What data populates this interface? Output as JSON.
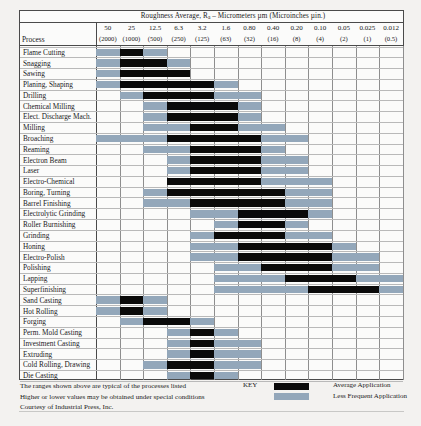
{
  "header": {
    "title_prefix": "Roughness Average, R",
    "title_sub": "a",
    "title_suffix": " – Micrometers µm (Microinches µin.)",
    "process_column_label": "Process"
  },
  "legend": {
    "key_word": "KEY",
    "avg_label": "Average Application",
    "less_label": "Less Frequent Application",
    "avg_color": "#0a0a0a",
    "less_color": "#93a7ba"
  },
  "footnotes": [
    "The ranges shown above are typical of the processes listed",
    "Higher or lower values may be obtained under special conditions",
    "Courtesy of Industrial Press, Inc."
  ],
  "chart_data": {
    "type": "heatmap",
    "title": "Roughness Average, Ra – Micrometers µm (Microinches µin.)",
    "xlabel": "",
    "ylabel": "Process",
    "legend_position": "bottom-right",
    "grid": true,
    "categories_micrometers": [
      "50",
      "25",
      "12.5",
      "6.3",
      "3.2",
      "1.6",
      "0.80",
      "0.40",
      "0.20",
      "0.10",
      "0.05",
      "0.025",
      "0.012"
    ],
    "categories_microinches": [
      "(2000)",
      "(1000)",
      "(500)",
      "(250)",
      "(125)",
      "(63)",
      "(32)",
      "(16)",
      "(8)",
      "(4)",
      "(2)",
      "(1)",
      "(0.5)"
    ],
    "value_legend": {
      "0": "none",
      "1": "Less Frequent Application",
      "2": "Average Application"
    },
    "rows": [
      {
        "process": "Flame Cutting",
        "values": [
          1,
          2,
          1,
          0,
          0,
          0,
          0,
          0,
          0,
          0,
          0,
          0,
          0
        ]
      },
      {
        "process": "Snagging",
        "values": [
          1,
          2,
          2,
          1,
          0,
          0,
          0,
          0,
          0,
          0,
          0,
          0,
          0
        ]
      },
      {
        "process": "Sawing",
        "values": [
          1,
          2,
          2,
          2,
          0,
          0,
          0,
          0,
          0,
          0,
          0,
          0,
          0
        ]
      },
      {
        "process": "Planing, Shaping",
        "values": [
          1,
          2,
          2,
          2,
          2,
          1,
          0,
          0,
          0,
          0,
          0,
          0,
          0
        ]
      },
      {
        "process": "Drilling",
        "values": [
          0,
          1,
          2,
          2,
          2,
          1,
          1,
          0,
          0,
          0,
          0,
          0,
          0
        ]
      },
      {
        "process": "Chemical Milling",
        "values": [
          0,
          0,
          1,
          2,
          2,
          2,
          1,
          0,
          0,
          0,
          0,
          0,
          0
        ]
      },
      {
        "process": "Elect. Discharge Mach.",
        "values": [
          0,
          0,
          1,
          2,
          2,
          2,
          1,
          0,
          0,
          0,
          0,
          0,
          0
        ]
      },
      {
        "process": "Milling",
        "values": [
          0,
          0,
          1,
          1,
          2,
          2,
          1,
          1,
          0,
          0,
          0,
          0,
          0
        ]
      },
      {
        "process": "Broaching",
        "values": [
          1,
          1,
          1,
          2,
          2,
          2,
          2,
          1,
          1,
          0,
          0,
          0,
          0
        ]
      },
      {
        "process": "Reaming",
        "values": [
          0,
          0,
          1,
          1,
          2,
          2,
          2,
          1,
          0,
          0,
          0,
          0,
          0
        ]
      },
      {
        "process": "Electron Beam",
        "values": [
          0,
          0,
          0,
          1,
          2,
          2,
          2,
          1,
          1,
          0,
          0,
          0,
          0
        ]
      },
      {
        "process": "Laser",
        "values": [
          0,
          0,
          0,
          1,
          2,
          2,
          2,
          1,
          1,
          0,
          0,
          0,
          0
        ]
      },
      {
        "process": "Electro-Chemical",
        "values": [
          0,
          0,
          0,
          2,
          2,
          2,
          2,
          1,
          1,
          1,
          0,
          0,
          0
        ]
      },
      {
        "process": "Boring, Turning",
        "values": [
          0,
          0,
          1,
          2,
          2,
          2,
          2,
          2,
          1,
          1,
          0,
          0,
          0
        ]
      },
      {
        "process": "Barrel Finishing",
        "values": [
          0,
          0,
          1,
          1,
          2,
          2,
          2,
          2,
          1,
          1,
          0,
          0,
          0
        ]
      },
      {
        "process": "Electrolytic Grinding",
        "values": [
          0,
          0,
          0,
          0,
          1,
          1,
          2,
          2,
          2,
          1,
          0,
          0,
          0
        ]
      },
      {
        "process": "Roller Burnishing",
        "values": [
          0,
          0,
          0,
          0,
          0,
          1,
          2,
          2,
          1,
          0,
          0,
          0,
          0
        ]
      },
      {
        "process": "Grinding",
        "values": [
          0,
          0,
          0,
          0,
          1,
          2,
          2,
          2,
          1,
          1,
          0,
          0,
          0
        ]
      },
      {
        "process": "Honing",
        "values": [
          0,
          0,
          0,
          0,
          1,
          1,
          2,
          2,
          2,
          2,
          1,
          0,
          0
        ]
      },
      {
        "process": "Electro-Polish",
        "values": [
          0,
          0,
          0,
          0,
          1,
          1,
          2,
          2,
          2,
          2,
          1,
          1,
          0
        ]
      },
      {
        "process": "Polishing",
        "values": [
          0,
          0,
          0,
          0,
          0,
          1,
          1,
          2,
          2,
          2,
          1,
          1,
          0
        ]
      },
      {
        "process": "Lapping",
        "values": [
          0,
          0,
          0,
          0,
          0,
          1,
          1,
          1,
          2,
          2,
          2,
          1,
          1
        ]
      },
      {
        "process": "Superfinishing",
        "values": [
          0,
          0,
          0,
          0,
          0,
          1,
          1,
          1,
          1,
          2,
          2,
          2,
          1
        ]
      },
      {
        "process": "Sand Casting",
        "values": [
          1,
          2,
          1,
          0,
          0,
          0,
          0,
          0,
          0,
          0,
          0,
          0,
          0
        ]
      },
      {
        "process": "Hot Rolling",
        "values": [
          1,
          2,
          1,
          0,
          0,
          0,
          0,
          0,
          0,
          0,
          0,
          0,
          0
        ]
      },
      {
        "process": "Forging",
        "values": [
          0,
          1,
          2,
          2,
          1,
          0,
          0,
          0,
          0,
          0,
          0,
          0,
          0
        ]
      },
      {
        "process": "Perm. Mold Casting",
        "values": [
          0,
          0,
          0,
          1,
          2,
          1,
          0,
          0,
          0,
          0,
          0,
          0,
          0
        ]
      },
      {
        "process": "Investment Casting",
        "values": [
          0,
          0,
          0,
          1,
          2,
          1,
          1,
          0,
          0,
          0,
          0,
          0,
          0
        ]
      },
      {
        "process": "Extruding",
        "values": [
          0,
          0,
          0,
          1,
          2,
          1,
          1,
          0,
          0,
          0,
          0,
          0,
          0
        ]
      },
      {
        "process": "Cold Rolling, Drawing",
        "values": [
          0,
          0,
          1,
          2,
          2,
          1,
          1,
          0,
          0,
          0,
          0,
          0,
          0
        ]
      },
      {
        "process": "Die Casting",
        "values": [
          0,
          0,
          0,
          1,
          2,
          1,
          0,
          0,
          0,
          0,
          0,
          0,
          0
        ]
      }
    ]
  }
}
